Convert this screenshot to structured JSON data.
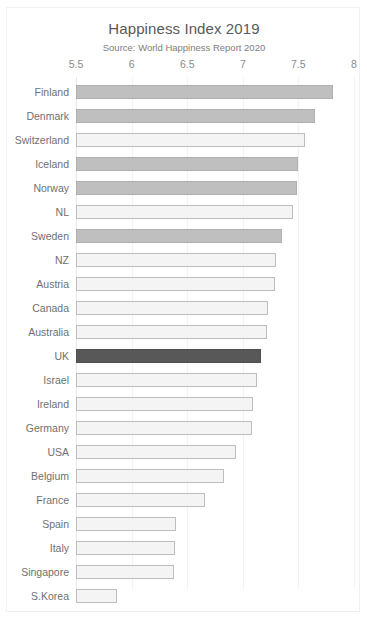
{
  "chart_data": {
    "type": "bar",
    "orientation": "horizontal",
    "title": "Happiness Index 2019",
    "subtitle": "Source: World Happiness Report 2020",
    "xlabel": "",
    "ylabel": "",
    "xlim": [
      5.5,
      8
    ],
    "grid": true,
    "legend": "none",
    "xticks": [
      "5.5",
      "6",
      "6.5",
      "7",
      "7.5",
      "8"
    ],
    "xtick_values": [
      5.5,
      6,
      6.5,
      7,
      7.5,
      8
    ],
    "categories": [
      "Finland",
      "Denmark",
      "Switzerland",
      "Iceland",
      "Norway",
      "NL",
      "Sweden",
      "NZ",
      "Austria",
      "Canada",
      "Australia",
      "UK",
      "Israel",
      "Ireland",
      "Germany",
      "USA",
      "Belgium",
      "France",
      "Spain",
      "Italy",
      "Singapore",
      "S.Korea"
    ],
    "values": [
      7.81,
      7.65,
      7.56,
      7.5,
      7.49,
      7.45,
      7.35,
      7.3,
      7.29,
      7.23,
      7.22,
      7.16,
      7.13,
      7.09,
      7.08,
      6.94,
      6.83,
      6.66,
      6.4,
      6.39,
      6.38,
      5.87
    ],
    "bar_styles": [
      "gray",
      "gray",
      "light",
      "gray",
      "gray",
      "light",
      "gray",
      "light",
      "light",
      "light",
      "light",
      "dark",
      "light",
      "light",
      "light",
      "light",
      "light",
      "light",
      "light",
      "light",
      "light",
      "light"
    ],
    "colors": {
      "gray": "#bfbfbf",
      "light": "#f4f4f4",
      "dark": "#585858",
      "bar_border": "#b4b4b4",
      "gridline": "#f2f2f2",
      "title_text": "#59595c",
      "subtitle_text": "#7d7d80",
      "tick_text": "#8a8a8d",
      "category_text": "#6f6f72",
      "frame_border": "#f0f0f0",
      "background": "#ffffff"
    }
  }
}
